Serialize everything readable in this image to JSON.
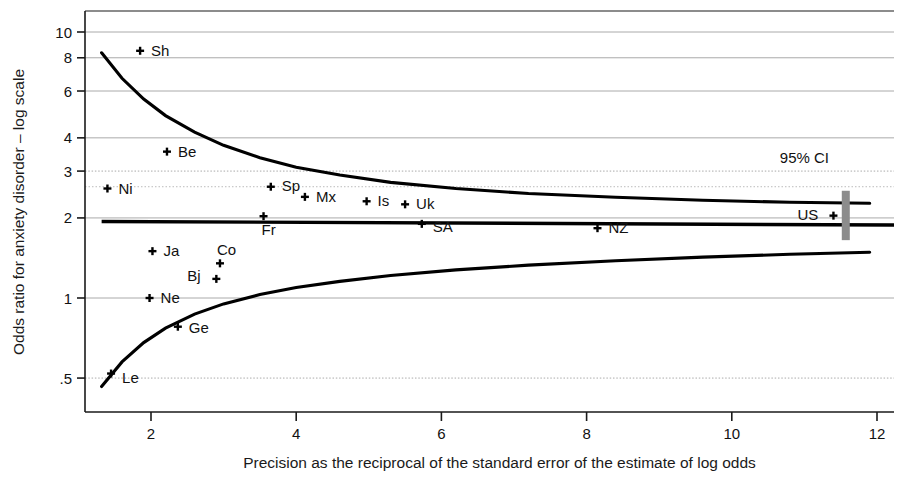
{
  "chart_data": {
    "type": "scatter",
    "title": "",
    "xlabel": "Precision as the reciprocal of the standard error of the estimate of log odds",
    "ylabel": "Odds ratio for anxiety disorder – log scale",
    "yscale": "log",
    "xlim": [
      1.2,
      12.35
    ],
    "ylim": [
      0.47,
      11.2
    ],
    "xticks": [
      2,
      4,
      6,
      8,
      10,
      12
    ],
    "xtick_labels": [
      "2",
      "4",
      "6",
      "8",
      "10",
      "12"
    ],
    "yticks": [
      0.5,
      1,
      2,
      3,
      4,
      6,
      8,
      10
    ],
    "ytick_labels": [
      ".5",
      "1",
      "2",
      "3",
      "4",
      "6",
      "8",
      "10"
    ],
    "grid": true,
    "grid_axis": "y",
    "legend": "none",
    "annotations": [
      {
        "text": "95% CI",
        "x": 11.0,
        "y": 3.35
      }
    ],
    "points": [
      {
        "label": "Sh",
        "x": 1.85,
        "y": 8.5
      },
      {
        "label": "Be",
        "x": 2.22,
        "y": 3.55
      },
      {
        "label": "Ni",
        "x": 1.4,
        "y": 2.58
      },
      {
        "label": "Sp",
        "x": 3.65,
        "y": 2.62
      },
      {
        "label": "Mx",
        "x": 4.12,
        "y": 2.4
      },
      {
        "label": "Is",
        "x": 4.97,
        "y": 2.31
      },
      {
        "label": "Uk",
        "x": 5.5,
        "y": 2.25
      },
      {
        "label": "Fr",
        "x": 3.55,
        "y": 2.03
      },
      {
        "label": "SA",
        "x": 5.73,
        "y": 1.9
      },
      {
        "label": "NZ",
        "x": 8.15,
        "y": 1.83
      },
      {
        "label": "US",
        "x": 11.4,
        "y": 2.04
      },
      {
        "label": "Ja",
        "x": 2.02,
        "y": 1.5
      },
      {
        "label": "Co",
        "x": 2.95,
        "y": 1.35
      },
      {
        "label": "Bj",
        "x": 2.9,
        "y": 1.18
      },
      {
        "label": "Ne",
        "x": 1.98,
        "y": 1.0
      },
      {
        "label": "Ge",
        "x": 2.37,
        "y": 0.78
      },
      {
        "label": "Le",
        "x": 1.45,
        "y": 0.52
      }
    ],
    "mean_line": {
      "y_start": 1.94,
      "y_end": 1.88
    },
    "funnel_upper": [
      {
        "x": 1.32,
        "y": 8.35
      },
      {
        "x": 1.6,
        "y": 6.7
      },
      {
        "x": 1.9,
        "y": 5.6
      },
      {
        "x": 2.2,
        "y": 4.85
      },
      {
        "x": 2.6,
        "y": 4.2
      },
      {
        "x": 3.0,
        "y": 3.75
      },
      {
        "x": 3.5,
        "y": 3.37
      },
      {
        "x": 4.0,
        "y": 3.1
      },
      {
        "x": 4.6,
        "y": 2.9
      },
      {
        "x": 5.3,
        "y": 2.72
      },
      {
        "x": 6.2,
        "y": 2.58
      },
      {
        "x": 7.2,
        "y": 2.47
      },
      {
        "x": 8.4,
        "y": 2.39
      },
      {
        "x": 9.6,
        "y": 2.33
      },
      {
        "x": 10.8,
        "y": 2.29
      },
      {
        "x": 11.9,
        "y": 2.27
      }
    ],
    "funnel_lower": [
      {
        "x": 1.32,
        "y": 0.465
      },
      {
        "x": 1.6,
        "y": 0.575
      },
      {
        "x": 1.9,
        "y": 0.68
      },
      {
        "x": 2.2,
        "y": 0.77
      },
      {
        "x": 2.6,
        "y": 0.87
      },
      {
        "x": 3.0,
        "y": 0.95
      },
      {
        "x": 3.5,
        "y": 1.03
      },
      {
        "x": 4.0,
        "y": 1.095
      },
      {
        "x": 4.6,
        "y": 1.155
      },
      {
        "x": 5.3,
        "y": 1.215
      },
      {
        "x": 6.2,
        "y": 1.275
      },
      {
        "x": 7.2,
        "y": 1.33
      },
      {
        "x": 8.4,
        "y": 1.38
      },
      {
        "x": 9.6,
        "y": 1.425
      },
      {
        "x": 10.8,
        "y": 1.46
      },
      {
        "x": 11.9,
        "y": 1.485
      }
    ],
    "us_ci_bar": {
      "x": 11.57,
      "y_low": 1.65,
      "y_high": 2.53,
      "color": "#8c8c8c"
    }
  },
  "colors": {
    "background": "#ffffff",
    "axis": "#1a1a1a",
    "grid": "#aaaaaa",
    "curve": "#000000",
    "marker": "#000000",
    "ci_bar": "#8c8c8c"
  }
}
